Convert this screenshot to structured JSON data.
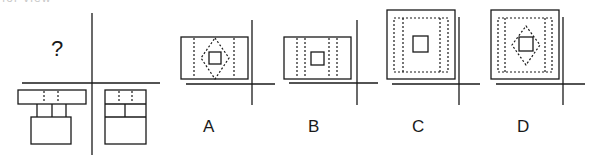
{
  "question": {
    "cut_off_text": "for view",
    "unknown_marker": "?",
    "views": {
      "top_left": "unknown (?)",
      "bottom_left": "front view: wide top bar with two dotted lines, two posts, base box",
      "bottom_right": "side view: box with top row (two dotted lines), middle row divided in two, large bottom cell"
    }
  },
  "options": [
    {
      "label": "A",
      "description": "Wide rectangle, two dotted verticals, dotted diamond around small square"
    },
    {
      "label": "B",
      "description": "Wide rectangle, four dotted verticals, small square in center"
    },
    {
      "label": "C",
      "description": "Square, dotted rectangle outline with inner dotted verticals, small square in center"
    },
    {
      "label": "D",
      "description": "Square, dotted rectangle outline with inner dotted verticals, dotted diamond around small square"
    }
  ],
  "colors": {
    "line": "#1a1a1a",
    "background": "#ffffff"
  }
}
